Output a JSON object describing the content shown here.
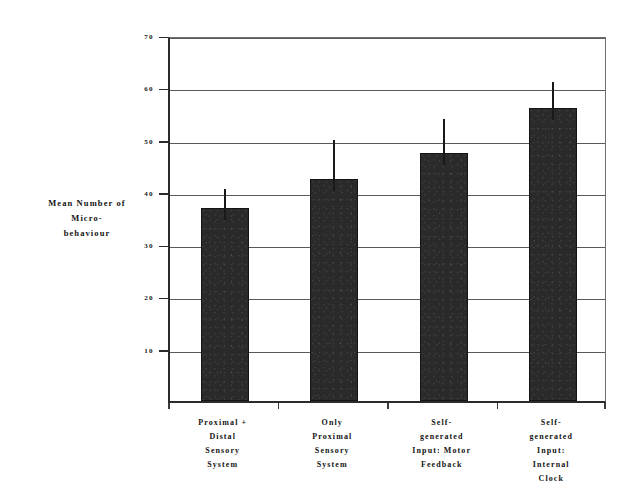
{
  "chart_data": {
    "type": "bar",
    "title": "",
    "xlabel": "",
    "ylabel": "Mean Number of Micro-behaviour",
    "ylabel_lines": [
      "Mean Number of",
      "Micro-",
      "behaviour"
    ],
    "categories": [
      "Proximal + Distal Sensory System",
      "Only Proximal Sensory System",
      "Self-generated Input: Motor Feedback",
      "Self-generated Input: Internal Clock"
    ],
    "category_lines": [
      [
        "Proximal +",
        "Distal",
        "Sensory",
        "System"
      ],
      [
        "Only",
        "Proximal",
        "Sensory",
        "System"
      ],
      [
        "Self-",
        "generated",
        "Input: Motor",
        "Feedback"
      ],
      [
        "Self-",
        "generated",
        "Input:",
        "Internal",
        "Clock"
      ]
    ],
    "values": [
      37,
      42.5,
      47.5,
      56
    ],
    "error_high": [
      40.5,
      50,
      54,
      61
    ],
    "error_low": [
      37,
      42.5,
      47.5,
      56
    ],
    "ylim": [
      0,
      70
    ],
    "yticks": [
      10,
      20,
      30,
      40,
      50,
      60,
      70
    ],
    "ytick_labels": [
      "10",
      "20",
      "30",
      "40",
      "50",
      "60",
      "70"
    ],
    "grid": true,
    "legend": "none",
    "bar_color": "#2a2a2a",
    "error_bar_color": "#191919",
    "axis_color": "#2b2b2b",
    "grid_color": "#5a5a5a",
    "background_color": "#ffffff"
  }
}
